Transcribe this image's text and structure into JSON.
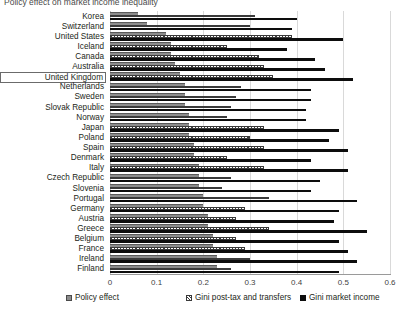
{
  "chart_data": {
    "type": "bar",
    "orientation": "horizontal",
    "title": "Policy effect on market income inequality",
    "xlabel": "",
    "ylabel": "",
    "xlim": [
      0,
      0.6
    ],
    "xticks": [
      "0",
      "0.1",
      "0.2",
      "0.3",
      "0.4",
      "0.5",
      "0.6"
    ],
    "grid": true,
    "legend_position": "bottom",
    "highlighted_category": "United Kingdom",
    "categories": [
      "Korea",
      "Switzerland",
      "United States",
      "Iceland",
      "Canada",
      "Australia",
      "United Kingdom",
      "Netherlands",
      "Sweden",
      "Slovak Republic",
      "Norway",
      "Japan",
      "Poland",
      "Spain",
      "Denmark",
      "Italy",
      "Czech Republic",
      "Slovenia",
      "Portugal",
      "Germany",
      "Austria",
      "Greece",
      "Belgium",
      "France",
      "Ireland",
      "Finland"
    ],
    "series": [
      {
        "name": "Policy effect",
        "values": [
          0.06,
          0.08,
          0.12,
          0.13,
          0.13,
          0.14,
          0.15,
          0.16,
          0.16,
          0.16,
          0.17,
          0.17,
          0.17,
          0.18,
          0.18,
          0.19,
          0.19,
          0.19,
          0.2,
          0.2,
          0.21,
          0.21,
          0.22,
          0.22,
          0.23,
          0.23
        ]
      },
      {
        "name": "Gini post-tax and transfers",
        "values": [
          0.31,
          0.3,
          0.39,
          0.25,
          0.32,
          0.33,
          0.35,
          0.28,
          0.27,
          0.26,
          0.25,
          0.33,
          0.3,
          0.33,
          0.25,
          0.33,
          0.26,
          0.24,
          0.34,
          0.29,
          0.27,
          0.34,
          0.27,
          0.29,
          0.3,
          0.26
        ]
      },
      {
        "name": "Gini market income",
        "values": [
          0.4,
          0.39,
          0.5,
          0.38,
          0.44,
          0.46,
          0.52,
          0.43,
          0.43,
          0.42,
          0.42,
          0.49,
          0.47,
          0.51,
          0.43,
          0.51,
          0.45,
          0.43,
          0.53,
          0.49,
          0.48,
          0.55,
          0.49,
          0.51,
          0.53,
          0.49
        ]
      }
    ]
  },
  "legend": {
    "items": [
      {
        "label": "Policy effect",
        "marker": "gray-square-swatch"
      },
      {
        "label": "Gini post-tax and transfers",
        "marker": "hatched-square-swatch"
      },
      {
        "label": "Gini market income",
        "marker": "black-square-swatch"
      }
    ]
  },
  "colors": {
    "policy_effect": "#8c8c8c",
    "gini_post_tax": "#3a3a3a",
    "gini_market": "#0d0d0d",
    "gridline": "#d9d9d9",
    "text": "#231f20"
  }
}
